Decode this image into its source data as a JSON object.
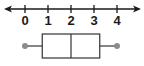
{
  "chart_data": {
    "type": "boxplot",
    "title": "",
    "xlabel": "",
    "ylabel": "",
    "axis": {
      "min": 0,
      "max": 4,
      "ticks": [
        0,
        1,
        2,
        3,
        4
      ],
      "tick_labels": [
        "0",
        "1",
        "2",
        "3",
        "4"
      ],
      "arrows_both_ends": true,
      "grid": false
    },
    "box": {
      "min": 0,
      "q1": 0.75,
      "median": 2,
      "q3": 3.25,
      "max": 4
    },
    "legend": null
  },
  "colors": {
    "line": "#333333",
    "whisker_dot": "#8c8c8c",
    "text": "#1a1a1a"
  }
}
